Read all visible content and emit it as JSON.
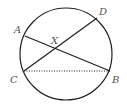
{
  "diagram": {
    "type": "circle-geometry",
    "circle": {
      "cx": 66,
      "cy": 54,
      "r": 46,
      "stroke": "#222222"
    },
    "points": {
      "A": {
        "label": "A",
        "x": 25,
        "y": 36
      },
      "B": {
        "label": "B",
        "x": 110,
        "y": 71
      },
      "C": {
        "label": "C",
        "x": 24,
        "y": 71
      },
      "D": {
        "label": "D",
        "x": 97,
        "y": 18
      },
      "X": {
        "label": "X",
        "x": 55,
        "y": 48
      }
    },
    "segments": [
      {
        "from": "A",
        "to": "B",
        "style": "solid"
      },
      {
        "from": "C",
        "to": "D",
        "style": "solid"
      },
      {
        "from": "C",
        "to": "B",
        "style": "dotted"
      }
    ],
    "label_color": "#555555"
  }
}
